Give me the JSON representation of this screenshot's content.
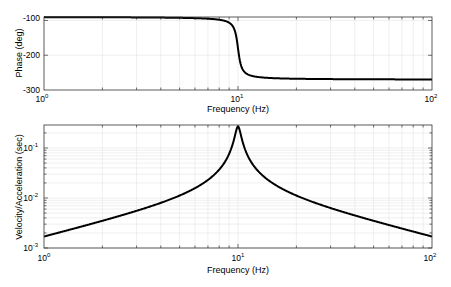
{
  "chart_data": [
    {
      "type": "line",
      "title": "",
      "xlabel": "Frequency (Hz)",
      "ylabel": "Phase (deg)",
      "xscale": "log",
      "yscale": "linear",
      "xlim": [
        1,
        100
      ],
      "ylim": [
        -300,
        -90
      ],
      "xticks": [
        1,
        10,
        100
      ],
      "xtick_labels": [
        "10^0",
        "10^1",
        "10^2"
      ],
      "yticks": [
        -100,
        -200,
        -300
      ],
      "ytick_labels": [
        "-100",
        "-200",
        "-300"
      ],
      "grid": true,
      "series": [
        {
          "name": "phase",
          "x": [
            1,
            2,
            3,
            5,
            7,
            8,
            9,
            9.5,
            10,
            10.5,
            11,
            12,
            15,
            20,
            30,
            50,
            100
          ],
          "values": [
            -90.4,
            -90.9,
            -91.2,
            -92.3,
            -94.9,
            -97.9,
            -106.3,
            -121.4,
            -180,
            -238.6,
            -253.2,
            -261.6,
            -266.3,
            -267.6,
            -268.6,
            -269.2,
            -269.6
          ]
        }
      ]
    },
    {
      "type": "line",
      "title": "",
      "xlabel": "Frequency (Hz)",
      "ylabel": "Velocity/Acceleration (sec)",
      "xscale": "log",
      "yscale": "log",
      "xlim": [
        1,
        100
      ],
      "ylim": [
        0.001,
        0.29
      ],
      "xticks": [
        1,
        10,
        100
      ],
      "xtick_labels": [
        "10^0",
        "10^1",
        "10^2"
      ],
      "yticks": [
        0.1,
        0.01,
        0.001
      ],
      "ytick_labels": [
        "10^-1",
        "10^-2",
        "10^-3"
      ],
      "grid": true,
      "series": [
        {
          "name": "velocity/acceleration",
          "x": [
            1,
            2,
            3,
            5,
            7,
            8,
            9,
            9.5,
            10,
            10.5,
            11,
            12,
            15,
            20,
            30,
            50,
            100
          ],
          "values": [
            0.0017,
            0.0035,
            0.0055,
            0.0112,
            0.023,
            0.037,
            0.078,
            0.14,
            0.27,
            0.14,
            0.08,
            0.046,
            0.02,
            0.0112,
            0.0063,
            0.0035,
            0.0017
          ]
        }
      ]
    }
  ],
  "top_plot": {
    "ylabel": "Phase (deg)",
    "xlabel": "Frequency (Hz)",
    "yticks": [
      "-100",
      "-200",
      "-300"
    ],
    "xtick_base": [
      "10",
      "10",
      "10"
    ],
    "xtick_exp": [
      "0",
      "1",
      "2"
    ]
  },
  "bottom_plot": {
    "ylabel": "Velocity/Acceleration (sec)",
    "xlabel": "Frequency (Hz)",
    "ytick_base": [
      "10",
      "10",
      "10"
    ],
    "ytick_exp": [
      "-1",
      "-2",
      "-3"
    ],
    "xtick_base": [
      "10",
      "10",
      "10"
    ],
    "xtick_exp": [
      "0",
      "1",
      "2"
    ]
  },
  "model": {
    "f0": 10,
    "zeta": 0.031,
    "gain": 0.0168
  },
  "colors": {
    "line": "#000000",
    "axes": "#222222",
    "grid": "#e4e4e4"
  }
}
